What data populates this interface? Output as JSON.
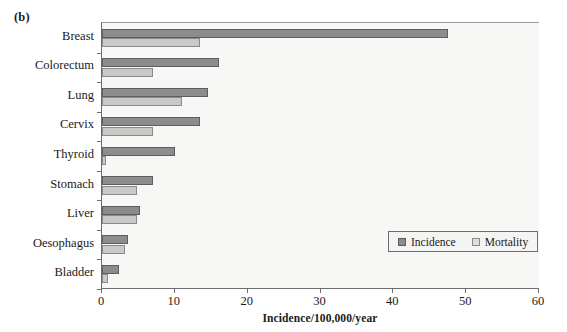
{
  "panel": {
    "label": "(b)"
  },
  "chart_data": {
    "type": "bar",
    "orientation": "horizontal",
    "title": "",
    "xlabel": "Incidence/100,000/year",
    "ylabel": "",
    "xlim": [
      0,
      60
    ],
    "xticks": [
      0,
      10,
      20,
      30,
      40,
      50,
      60
    ],
    "grid": false,
    "legend_position": "bottom-right",
    "categories": [
      "Breast",
      "Colorectum",
      "Lung",
      "Cervix",
      "Thyroid",
      "Stomach",
      "Liver",
      "Oesophagus",
      "Bladder"
    ],
    "series": [
      {
        "name": "Incidence",
        "color": "#8c8c8c",
        "values": [
          47.5,
          16.0,
          14.5,
          13.5,
          10.0,
          7.0,
          5.2,
          3.6,
          2.4
        ]
      },
      {
        "name": "Mortality",
        "color": "#c9c9c7",
        "values": [
          13.5,
          7.0,
          11.0,
          7.0,
          0.5,
          4.8,
          4.8,
          3.1,
          0.8
        ]
      }
    ]
  },
  "legend": {
    "items": [
      {
        "label": "Incidence",
        "swatch": "incidence"
      },
      {
        "label": "Mortality",
        "swatch": "mortality"
      }
    ]
  },
  "axis": {
    "x_tick_labels": [
      "0",
      "10",
      "20",
      "30",
      "40",
      "50",
      "60"
    ],
    "x_axis_title": "Incidence/100,000/year"
  }
}
